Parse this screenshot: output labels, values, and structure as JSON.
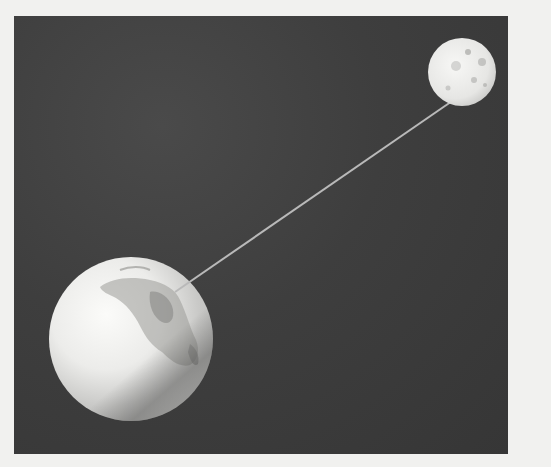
{
  "scene": {
    "description": "Illustration of Earth and Moon connected by a straight line against a dark space background",
    "background_color": "#3d3d3d",
    "page_color": "#f1f1ef",
    "frame": {
      "x": 14,
      "y": 16,
      "width": 494,
      "height": 438
    },
    "earth": {
      "cx": 131,
      "cy": 339,
      "r": 82,
      "label": "earth"
    },
    "moon": {
      "cx": 462,
      "cy": 72,
      "r": 34,
      "label": "moon"
    },
    "connecting_line": {
      "x1": 175,
      "y1": 292,
      "x2": 458,
      "y2": 97,
      "color": "#b9b9b9"
    }
  }
}
